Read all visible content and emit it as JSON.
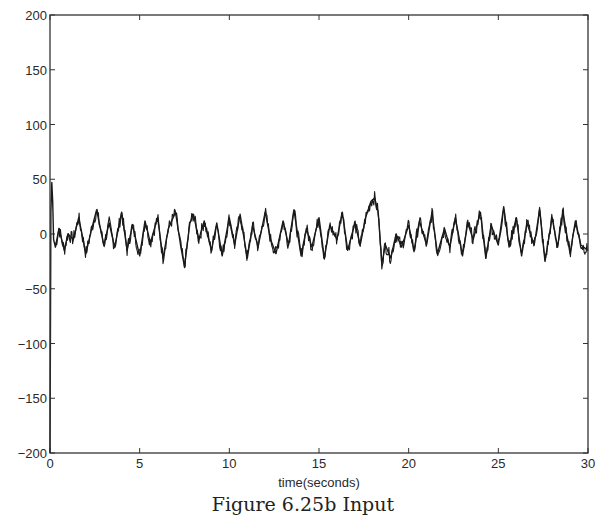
{
  "caption": "Figure 6.25b Input",
  "chart_data": {
    "type": "line",
    "title": "",
    "xlabel": "time(seconds)",
    "ylabel": "",
    "xlim": [
      0,
      30
    ],
    "ylim": [
      -200,
      200
    ],
    "x_ticks": [
      0,
      5,
      10,
      15,
      20,
      25,
      30
    ],
    "y_ticks": [
      200,
      150,
      100,
      50,
      0,
      -50,
      -100,
      -150,
      -200
    ],
    "grid": false,
    "legend": null,
    "series": [
      {
        "name": "input",
        "color": "#1a1a1a",
        "description": "Noisy input signal oscillating roughly between -25 and +30 about zero; initial transient spike from about -200 up to +47 at t≈0.1 s; local peak ≈ +33 near t≈18 s followed by dip ≈ -27 near t≈18.5 s.",
        "x": [
          0,
          0.05,
          0.1,
          0.15,
          0.2,
          0.3,
          0.5,
          0.8,
          1.0,
          1.3,
          1.6,
          2.0,
          2.3,
          2.6,
          3.0,
          3.3,
          3.6,
          4.0,
          4.3,
          4.6,
          5.0,
          5.3,
          5.6,
          6.0,
          6.3,
          6.6,
          7.0,
          7.3,
          7.5,
          7.8,
          8.0,
          8.3,
          8.6,
          9.0,
          9.3,
          9.6,
          10.0,
          10.3,
          10.6,
          11.0,
          11.3,
          11.6,
          12.0,
          12.3,
          12.6,
          13.0,
          13.3,
          13.6,
          14.0,
          14.3,
          14.6,
          15.0,
          15.3,
          15.6,
          16.0,
          16.3,
          16.6,
          17.0,
          17.3,
          17.6,
          17.9,
          18.1,
          18.3,
          18.5,
          18.7,
          19.0,
          19.3,
          19.6,
          20.0,
          20.3,
          20.6,
          21.0,
          21.3,
          21.6,
          22.0,
          22.3,
          22.6,
          23.0,
          23.3,
          23.6,
          24.0,
          24.3,
          24.6,
          25.0,
          25.3,
          25.6,
          26.0,
          26.3,
          26.6,
          27.0,
          27.3,
          27.6,
          28.0,
          28.3,
          28.6,
          29.0,
          29.3,
          29.6,
          30.0
        ],
        "y": [
          -200,
          20,
          47,
          30,
          -5,
          -12,
          5,
          -15,
          0,
          -5,
          15,
          -18,
          3,
          22,
          -10,
          10,
          -12,
          20,
          -15,
          8,
          -20,
          12,
          -8,
          15,
          -22,
          5,
          20,
          -12,
          -30,
          10,
          18,
          -5,
          12,
          -15,
          10,
          -20,
          15,
          -10,
          18,
          -22,
          8,
          -12,
          20,
          -5,
          -18,
          12,
          -10,
          22,
          -20,
          5,
          -12,
          15,
          -22,
          8,
          -5,
          20,
          -15,
          10,
          -10,
          15,
          30,
          33,
          20,
          -27,
          -10,
          -22,
          0,
          -12,
          8,
          -15,
          12,
          -10,
          20,
          -18,
          5,
          -12,
          15,
          -20,
          10,
          -5,
          20,
          -22,
          8,
          -10,
          25,
          -12,
          15,
          -20,
          10,
          -10,
          22,
          -25,
          15,
          -12,
          20,
          -18,
          12,
          -10,
          -15
        ]
      }
    ]
  }
}
